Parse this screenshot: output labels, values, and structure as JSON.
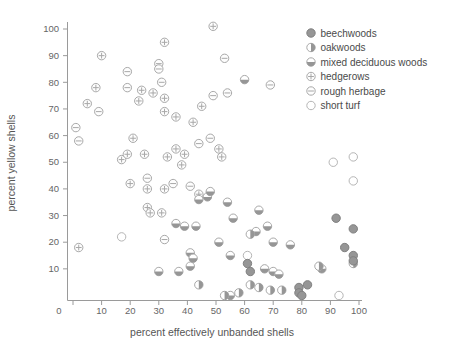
{
  "figure": {
    "background": "#ffffff"
  },
  "chart_data": {
    "type": "scatter",
    "title": "",
    "xlabel": "percent effectively unbanded shells",
    "ylabel": "percent yellow shells",
    "xlim": [
      0,
      100
    ],
    "ylim": [
      0,
      100
    ],
    "xticks": [
      0,
      10,
      20,
      30,
      40,
      50,
      60,
      70,
      80,
      90,
      100
    ],
    "yticks": [
      10,
      20,
      30,
      40,
      50,
      60,
      70,
      80,
      90,
      100
    ],
    "grid": false,
    "legend_position": "top-right",
    "colors": {
      "dark_fill": "#969696",
      "dark_stroke": "#808080",
      "light_stroke": "#a8a8a8",
      "open_stroke": "#b5b5b5",
      "axis": "#9a9a9a",
      "light_fill": "#fdfdfd"
    },
    "series": [
      {
        "name": "beechwoods",
        "marker": "filled-circle",
        "points": [
          [
            61,
            12
          ],
          [
            62,
            9
          ],
          [
            79,
            3
          ],
          [
            79,
            1
          ],
          [
            80,
            0
          ],
          [
            82,
            4
          ],
          [
            92,
            29
          ],
          [
            95,
            18
          ],
          [
            98,
            25
          ],
          [
            98,
            15
          ],
          [
            98,
            13
          ]
        ]
      },
      {
        "name": "oakwoods",
        "marker": "half-filled-circle-vertical",
        "points": [
          [
            44,
            4
          ],
          [
            53,
            0
          ],
          [
            58,
            1
          ],
          [
            62,
            4
          ],
          [
            62,
            23
          ],
          [
            65,
            3
          ],
          [
            69,
            2
          ],
          [
            73,
            2
          ],
          [
            86,
            11
          ],
          [
            98,
            12
          ]
        ]
      },
      {
        "name": "mixed deciduous woods",
        "marker": "half-filled-circle-horizontal",
        "points": [
          [
            30,
            9
          ],
          [
            36,
            27
          ],
          [
            37,
            9
          ],
          [
            39,
            26
          ],
          [
            41,
            16
          ],
          [
            41,
            11
          ],
          [
            42,
            14
          ],
          [
            43,
            26
          ],
          [
            44,
            36
          ],
          [
            47,
            37
          ],
          [
            48,
            39
          ],
          [
            51,
            20
          ],
          [
            54,
            35
          ],
          [
            55,
            15
          ],
          [
            55,
            0
          ],
          [
            56,
            29
          ],
          [
            60,
            81
          ],
          [
            64,
            24
          ],
          [
            65,
            32
          ],
          [
            67,
            10
          ],
          [
            68,
            26
          ],
          [
            70,
            20
          ],
          [
            70,
            9
          ],
          [
            72,
            8
          ],
          [
            76,
            19
          ],
          [
            87,
            10
          ]
        ]
      },
      {
        "name": "hedgerows",
        "marker": "circle-plus",
        "points": [
          [
            2,
            18
          ],
          [
            5,
            72
          ],
          [
            8,
            78
          ],
          [
            10,
            90
          ],
          [
            17,
            51
          ],
          [
            19,
            53
          ],
          [
            20,
            42
          ],
          [
            21,
            59
          ],
          [
            23,
            73
          ],
          [
            24,
            77
          ],
          [
            25,
            53
          ],
          [
            26,
            40
          ],
          [
            26,
            33
          ],
          [
            27,
            31
          ],
          [
            28,
            76
          ],
          [
            31,
            31
          ],
          [
            32,
            95
          ],
          [
            32,
            74
          ],
          [
            32,
            69
          ],
          [
            32,
            40
          ],
          [
            33,
            52
          ],
          [
            36,
            67
          ],
          [
            36,
            55
          ],
          [
            38,
            49
          ],
          [
            39,
            53
          ],
          [
            42,
            65
          ],
          [
            44,
            38
          ],
          [
            45,
            71
          ],
          [
            49,
            101
          ],
          [
            51,
            55
          ],
          [
            52,
            52
          ]
        ]
      },
      {
        "name": "rough herbage",
        "marker": "circle-minus",
        "points": [
          [
            1,
            63
          ],
          [
            2,
            58
          ],
          [
            9,
            69
          ],
          [
            19,
            84
          ],
          [
            19,
            78
          ],
          [
            26,
            44
          ],
          [
            30,
            87
          ],
          [
            30,
            85
          ],
          [
            31,
            80
          ],
          [
            32,
            21
          ],
          [
            35,
            42
          ],
          [
            41,
            41
          ],
          [
            44,
            57
          ],
          [
            48,
            59
          ],
          [
            49,
            75
          ],
          [
            53,
            89
          ],
          [
            54,
            76
          ],
          [
            69,
            79
          ]
        ]
      },
      {
        "name": "short turf",
        "marker": "open-circle",
        "points": [
          [
            17,
            22
          ],
          [
            61,
            15
          ],
          [
            91,
            50
          ],
          [
            93,
            0
          ],
          [
            98,
            52
          ],
          [
            98,
            43
          ]
        ]
      }
    ]
  }
}
